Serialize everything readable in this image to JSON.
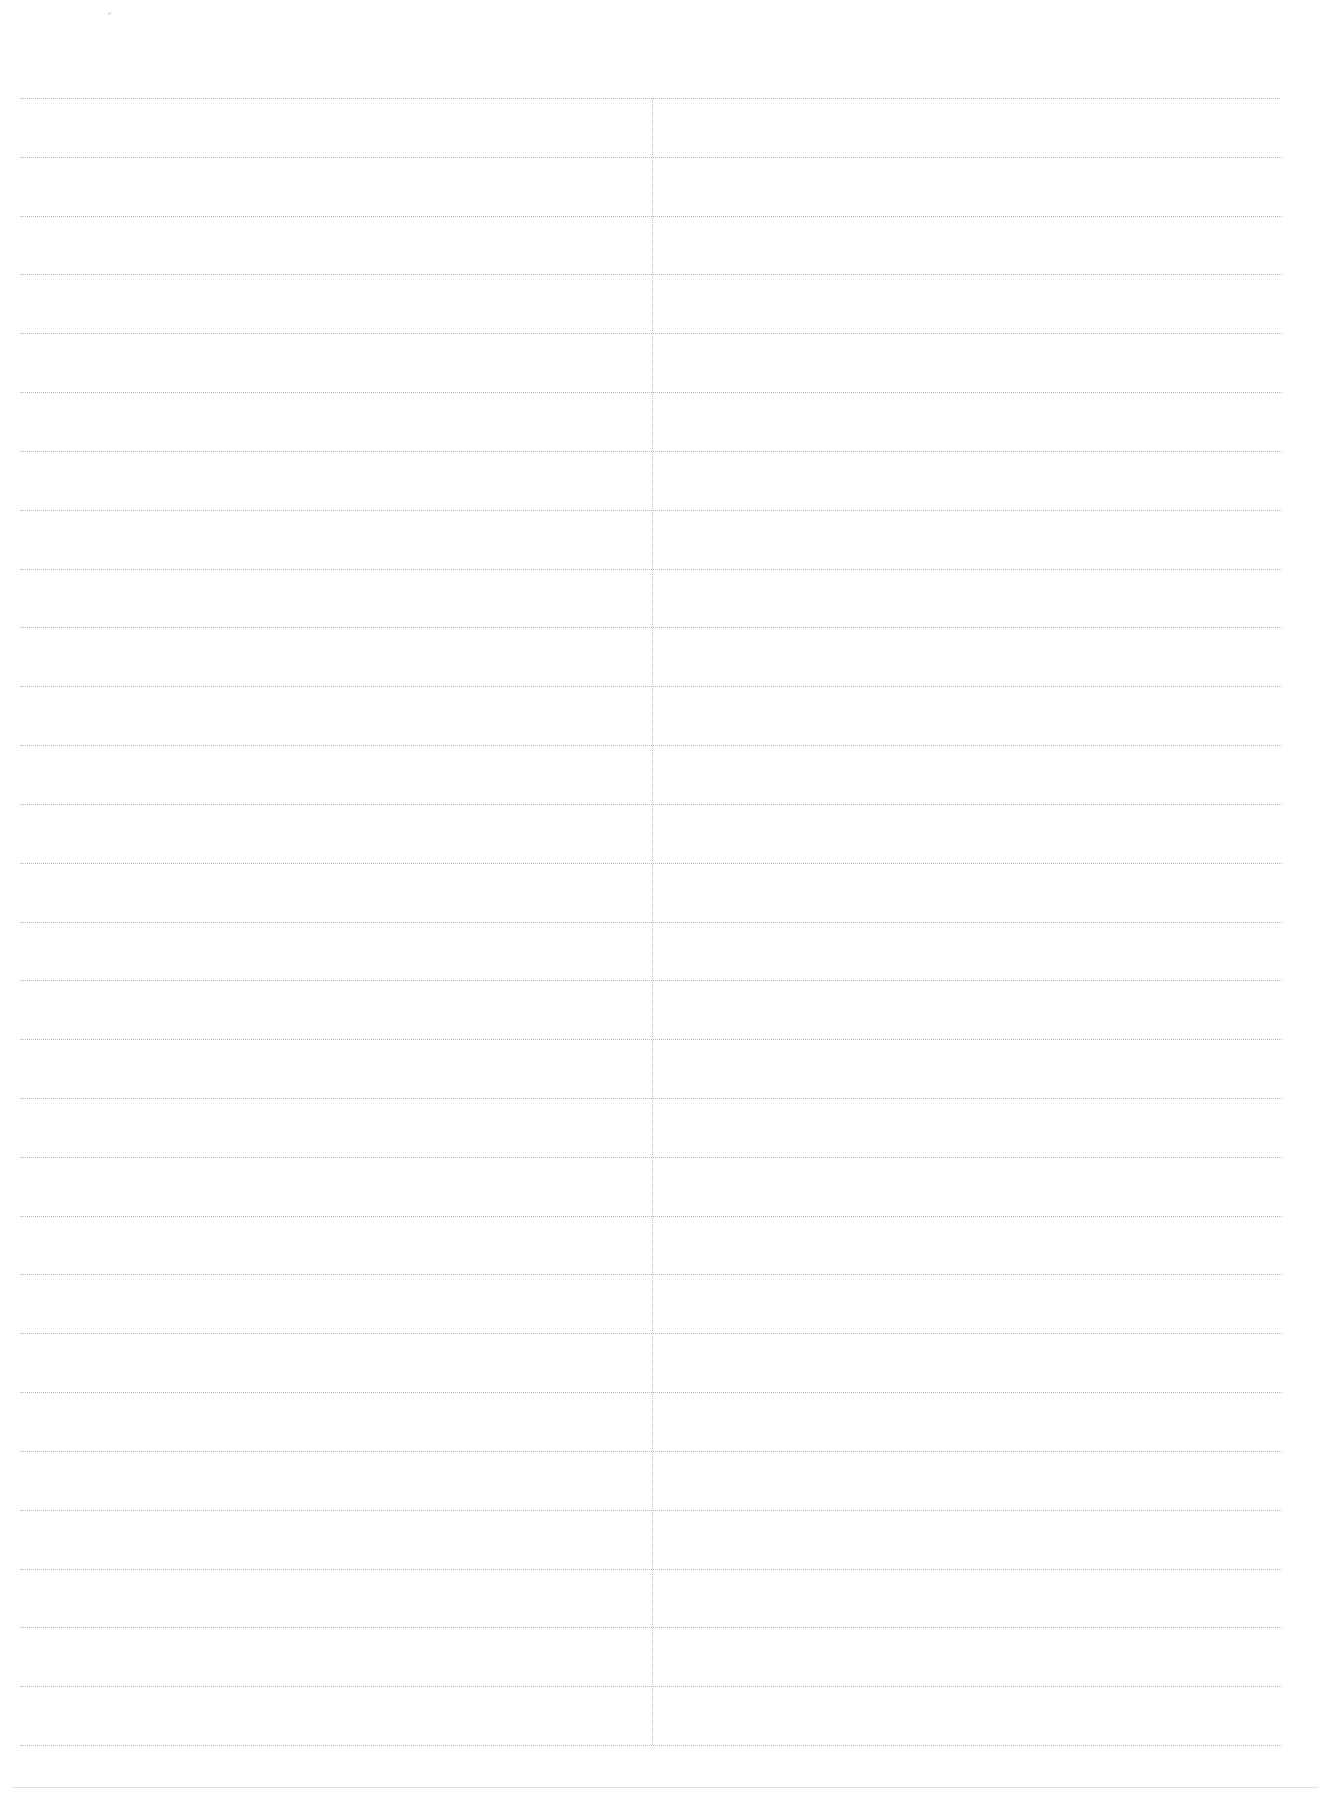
{
  "document": {
    "type": "blank ruled form",
    "columns": 2,
    "rows": 28,
    "colors": {
      "rule": "#b9b9b9",
      "divider": "#bdbdbd",
      "bottom_rule": "#e0e0e0",
      "paper": "#ffffff"
    },
    "table": {
      "headers": [
        "",
        ""
      ],
      "cells": []
    }
  }
}
